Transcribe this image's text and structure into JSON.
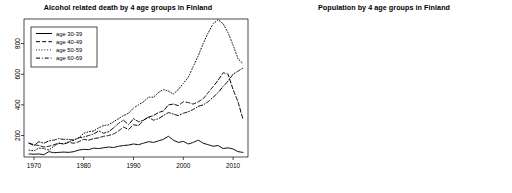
{
  "figure": {
    "background": "#ffffff",
    "panel_count": 2
  },
  "panels": [
    {
      "id": "alcohol-deaths",
      "title": "Alcohol related death by 4 age groups in Finland"
    },
    {
      "id": "population",
      "title": "Population by 4 age groups in Finland"
    }
  ],
  "legend": {
    "entries": [
      {
        "label": "age 30-39",
        "style": "solid"
      },
      {
        "label": "age 40-49",
        "style": "dashed"
      },
      {
        "label": "age 50-59",
        "style": "dotted"
      },
      {
        "label": "age 60-69",
        "style": "dashdot"
      }
    ]
  },
  "axis": {
    "left_y_ticks": [
      "200",
      "400",
      "600",
      "800"
    ],
    "right_y_ticks": [
      "4",
      "5",
      "6",
      "7",
      "8"
    ],
    "x_ticks": [
      "1970",
      "1980",
      "1990",
      "2000",
      "2010"
    ]
  },
  "chart_data": [
    {
      "type": "line",
      "title": "Alcohol related death by 4 age groups in Finland",
      "xlabel": "",
      "ylabel": "",
      "xlim": [
        1968,
        2013
      ],
      "ylim": [
        60,
        960
      ],
      "grid": false,
      "legend_position": "top-left",
      "xticks": [
        1970,
        1980,
        1990,
        2000,
        2010
      ],
      "yticks": [
        200,
        400,
        600,
        800
      ],
      "x": [
        1969,
        1970,
        1971,
        1972,
        1973,
        1974,
        1975,
        1976,
        1977,
        1978,
        1979,
        1980,
        1981,
        1982,
        1983,
        1984,
        1985,
        1986,
        1987,
        1988,
        1989,
        1990,
        1991,
        1992,
        1993,
        1994,
        1995,
        1996,
        1997,
        1998,
        1999,
        2000,
        2001,
        2002,
        2003,
        2004,
        2005,
        2006,
        2007,
        2008,
        2009,
        2010,
        2011,
        2012
      ],
      "series": [
        {
          "name": "age 30-39",
          "style": "solid",
          "values": [
            80,
            78,
            80,
            75,
            95,
            88,
            90,
            92,
            90,
            95,
            105,
            110,
            108,
            118,
            115,
            120,
            125,
            122,
            130,
            135,
            138,
            145,
            140,
            150,
            160,
            155,
            165,
            175,
            195,
            170,
            155,
            162,
            145,
            155,
            170,
            150,
            140,
            130,
            135,
            115,
            120,
            112,
            95,
            90
          ]
        },
        {
          "name": "age 40-49",
          "style": "dashed",
          "values": [
            150,
            140,
            135,
            125,
            130,
            140,
            150,
            145,
            155,
            150,
            160,
            175,
            170,
            180,
            185,
            195,
            200,
            210,
            230,
            255,
            240,
            270,
            265,
            300,
            320,
            330,
            350,
            360,
            400,
            405,
            395,
            420,
            415,
            405,
            420,
            440,
            480,
            520,
            560,
            610,
            600,
            500,
            420,
            305
          ]
        },
        {
          "name": "age 50-59",
          "style": "dotted",
          "values": [
            105,
            100,
            118,
            115,
            105,
            130,
            150,
            145,
            160,
            170,
            185,
            215,
            225,
            230,
            250,
            265,
            270,
            290,
            310,
            330,
            345,
            380,
            400,
            420,
            450,
            450,
            480,
            500,
            490,
            470,
            500,
            540,
            580,
            650,
            720,
            800,
            870,
            930,
            955,
            930,
            870,
            790,
            700,
            670
          ]
        },
        {
          "name": "age 60-69",
          "style": "dashdot",
          "values": [
            150,
            135,
            160,
            150,
            165,
            170,
            180,
            175,
            175,
            170,
            185,
            190,
            200,
            210,
            230,
            215,
            225,
            250,
            280,
            300,
            270,
            310,
            290,
            300,
            320,
            300,
            310,
            330,
            350,
            340,
            330,
            345,
            355,
            370,
            390,
            400,
            420,
            450,
            480,
            520,
            555,
            600,
            620,
            640
          ]
        }
      ]
    },
    {
      "type": "line",
      "title": "Population by 4 age groups in Finland",
      "xlabel": "",
      "ylabel": "",
      "xlim": [
        1968,
        2013
      ],
      "ylim": [
        3.85,
        8.55
      ],
      "grid": false,
      "legend_position": "top-left",
      "xticks": [
        1970,
        1980,
        1990,
        2000,
        2010
      ],
      "yticks": [
        4,
        5,
        6,
        7,
        8
      ],
      "x": [
        1969,
        1970,
        1971,
        1972,
        1973,
        1974,
        1975,
        1976,
        1977,
        1978,
        1979,
        1980,
        1981,
        1982,
        1983,
        1984,
        1985,
        1986,
        1987,
        1988,
        1989,
        1990,
        1991,
        1992,
        1993,
        1994,
        1995,
        1996,
        1997,
        1998,
        1999,
        2000,
        2001,
        2002,
        2003,
        2004,
        2005,
        2006,
        2007,
        2008,
        2009,
        2010,
        2011,
        2012
      ],
      "series": [
        {
          "name": "age 30-39",
          "style": "solid",
          "values": [
            5.72,
            5.66,
            5.7,
            5.78,
            5.92,
            6.1,
            6.32,
            6.58,
            6.86,
            7.16,
            7.48,
            7.76,
            8.0,
            8.2,
            8.33,
            8.4,
            8.38,
            8.3,
            8.18,
            8.05,
            7.96,
            7.92,
            7.92,
            7.9,
            7.86,
            7.8,
            7.72,
            7.62,
            7.52,
            7.42,
            7.32,
            7.2,
            7.08,
            6.98,
            6.88,
            6.8,
            6.74,
            6.7,
            6.66,
            6.64,
            6.66,
            6.72,
            6.84,
            6.96
          ]
        },
        {
          "name": "age 40-49",
          "style": "dashed",
          "values": [
            5.7,
            5.6,
            5.58,
            5.54,
            5.5,
            5.48,
            5.46,
            5.46,
            5.47,
            5.5,
            5.55,
            5.62,
            5.76,
            6.0,
            6.32,
            6.72,
            7.12,
            7.48,
            7.76,
            7.96,
            8.1,
            8.2,
            8.28,
            8.34,
            8.37,
            8.35,
            8.32,
            8.26,
            8.18,
            8.08,
            8.0,
            7.92,
            7.86,
            7.8,
            7.74,
            7.68,
            7.62,
            7.56,
            7.48,
            7.4,
            7.3,
            7.22,
            7.14,
            6.98
          ]
        },
        {
          "name": "age 50-59",
          "style": "dotted",
          "values": [
            4.84,
            4.84,
            4.86,
            4.9,
            4.96,
            5.02,
            5.1,
            5.18,
            5.26,
            5.32,
            5.36,
            5.38,
            5.38,
            5.36,
            5.34,
            5.32,
            5.32,
            5.32,
            5.34,
            5.38,
            5.44,
            5.52,
            5.64,
            5.8,
            6.0,
            6.22,
            6.46,
            6.7,
            6.94,
            7.16,
            7.38,
            7.58,
            7.74,
            7.88,
            7.98,
            8.06,
            8.1,
            8.1,
            8.06,
            8.0,
            7.92,
            7.82,
            7.7,
            7.46
          ]
        },
        {
          "name": "age 60-69",
          "style": "dashdot",
          "values": [
            4.02,
            4.06,
            4.12,
            4.18,
            4.22,
            4.24,
            4.24,
            4.22,
            4.2,
            4.19,
            4.18,
            4.18,
            4.2,
            4.24,
            4.32,
            4.42,
            4.52,
            4.62,
            4.7,
            4.76,
            4.8,
            4.82,
            4.83,
            4.84,
            4.86,
            4.88,
            4.9,
            4.92,
            4.94,
            4.98,
            5.02,
            5.08,
            5.18,
            5.32,
            5.52,
            5.76,
            6.02,
            6.3,
            6.58,
            6.8,
            6.96,
            7.04,
            7.06,
            6.98
          ]
        }
      ]
    }
  ]
}
